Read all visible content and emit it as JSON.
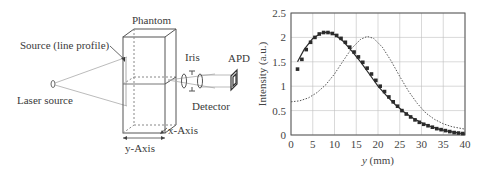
{
  "diagram": {
    "labels": {
      "phantom": "Phantom",
      "source": "Source (line profile)",
      "laser": "Laser source",
      "iris": "Iris",
      "apd": "APD",
      "detector": "Detector",
      "x_axis": "x-Axis",
      "y_axis": "y-Axis"
    }
  },
  "chart_data": {
    "type": "line",
    "title": "",
    "xlabel": "y (mm)",
    "ylabel": "Intensity (a.u.)",
    "xlim": [
      0,
      40
    ],
    "ylim": [
      0,
      2.5
    ],
    "xticks": [
      0,
      5,
      10,
      15,
      20,
      25,
      30,
      35,
      40
    ],
    "yticks": [
      0,
      0.5,
      1,
      1.5,
      2,
      2.5
    ],
    "ytick_labels": [
      "0",
      "0.5",
      "1",
      "1.5",
      "2",
      "2.5"
    ],
    "grid": true,
    "legend": null,
    "series": [
      {
        "name": "measured (squares)",
        "style": "markers",
        "x": [
          1.5,
          2.5,
          3.5,
          4.5,
          5.5,
          6.5,
          7.5,
          8.5,
          9.5,
          10.5,
          11.5,
          12.5,
          13.5,
          14.5,
          15.5,
          16.5,
          17.5,
          18.5,
          19.5,
          20.5,
          21.5,
          22.5,
          23.5,
          24.5,
          25.5,
          26.5,
          27.5,
          28.5,
          29.5,
          30.5,
          31.5,
          32.5,
          33.5,
          34.5,
          35.5,
          36.5,
          37.5,
          38.5,
          39.5
        ],
        "y": [
          1.35,
          1.55,
          1.75,
          1.9,
          2.0,
          2.07,
          2.1,
          2.1,
          2.08,
          2.04,
          1.98,
          1.9,
          1.8,
          1.7,
          1.6,
          1.49,
          1.37,
          1.25,
          1.12,
          1.0,
          0.89,
          0.78,
          0.68,
          0.59,
          0.5,
          0.43,
          0.37,
          0.31,
          0.26,
          0.22,
          0.19,
          0.16,
          0.13,
          0.11,
          0.09,
          0.07,
          0.05,
          0.04,
          0.03
        ]
      },
      {
        "name": "fit (solid)",
        "style": "solid",
        "x": [
          1.5,
          3,
          5,
          7,
          8.5,
          10,
          12,
          14,
          16,
          18,
          20,
          22,
          24,
          26,
          28,
          30,
          32,
          34,
          36,
          38,
          40
        ],
        "y": [
          1.5,
          1.75,
          1.98,
          2.09,
          2.11,
          2.06,
          1.92,
          1.72,
          1.5,
          1.25,
          1.0,
          0.8,
          0.62,
          0.47,
          0.35,
          0.25,
          0.18,
          0.12,
          0.08,
          0.05,
          0.02
        ]
      },
      {
        "name": "dotted curve",
        "style": "dotted",
        "x": [
          0,
          2,
          4,
          6,
          8,
          10,
          12,
          14,
          16,
          17.5,
          19,
          21,
          23,
          25,
          27,
          29,
          31,
          33,
          35,
          37,
          40
        ],
        "y": [
          0.68,
          0.7,
          0.76,
          0.87,
          1.03,
          1.25,
          1.52,
          1.78,
          1.96,
          2.02,
          1.98,
          1.8,
          1.52,
          1.2,
          0.9,
          0.65,
          0.45,
          0.32,
          0.23,
          0.17,
          0.12
        ]
      }
    ],
    "colors": {
      "markers": "#2b2b2b",
      "solid": "#2b2b2b",
      "dotted": "#555555",
      "grid": "#bfbfbf",
      "axes": "#555555"
    }
  }
}
